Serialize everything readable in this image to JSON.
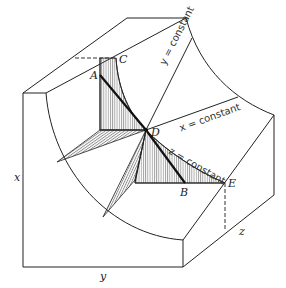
{
  "figure": {
    "colors": {
      "stroke": "#222222",
      "hatch": "#555555",
      "background": "#ffffff"
    },
    "points": {
      "A": "A",
      "B": "B",
      "C": "C",
      "D": "D",
      "E": "E"
    },
    "axes": {
      "x": "x",
      "y": "y",
      "z": "z"
    },
    "curves": {
      "y_const": "y = constant",
      "x_const": "x = constant",
      "z_const": "z = constant"
    }
  }
}
